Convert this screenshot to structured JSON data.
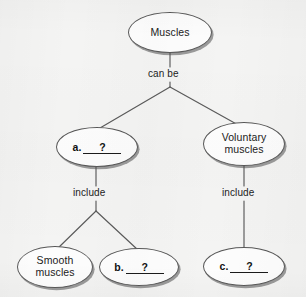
{
  "diagram": {
    "type": "concept-map",
    "background_color": "#f4f4f3",
    "node_fill_color": "#fdfdfd",
    "node_border_color": "#585858",
    "line_color": "#5a5a5a",
    "text_color": "#1b1b1b",
    "nodes": [
      {
        "id": "muscles",
        "label": "Muscles",
        "kind": "text",
        "x": 128,
        "y": 12,
        "w": 84,
        "h": 41
      },
      {
        "id": "blank-a",
        "label": "a.   ?",
        "kind": "blank",
        "letter": "a.",
        "blank_value": "?",
        "x": 56,
        "y": 127,
        "w": 82,
        "h": 40
      },
      {
        "id": "voluntary-muscles",
        "label": "Voluntary\nmuscles",
        "kind": "text",
        "x": 203,
        "y": 122,
        "w": 82,
        "h": 44
      },
      {
        "id": "smooth-muscles",
        "label": "Smooth\nmuscles",
        "kind": "text",
        "x": 17,
        "y": 246,
        "w": 76,
        "h": 42
      },
      {
        "id": "blank-b",
        "label": "b.   ?",
        "kind": "blank",
        "letter": "b.",
        "blank_value": "?",
        "x": 99,
        "y": 248,
        "w": 80,
        "h": 38
      },
      {
        "id": "blank-c",
        "label": "c.   ?",
        "kind": "blank",
        "letter": "c.",
        "blank_value": "?",
        "x": 203,
        "y": 247,
        "w": 82,
        "h": 39
      }
    ],
    "connector_labels": [
      {
        "id": "can-be",
        "text": "can be",
        "x": 145,
        "y": 69
      },
      {
        "id": "include-left",
        "text": "include",
        "x": 70,
        "y": 188
      },
      {
        "id": "include-right",
        "text": "include",
        "x": 219,
        "y": 188
      }
    ],
    "edges": [
      {
        "from": "muscles",
        "to": "branch-top",
        "via": "can be"
      },
      {
        "from": "branch-top",
        "to": "blank-a"
      },
      {
        "from": "branch-top",
        "to": "voluntary-muscles"
      },
      {
        "from": "blank-a",
        "to": "branch-left",
        "via": "include"
      },
      {
        "from": "branch-left",
        "to": "smooth-muscles"
      },
      {
        "from": "branch-left",
        "to": "blank-b"
      },
      {
        "from": "voluntary-muscles",
        "to": "blank-c",
        "via": "include"
      }
    ]
  }
}
